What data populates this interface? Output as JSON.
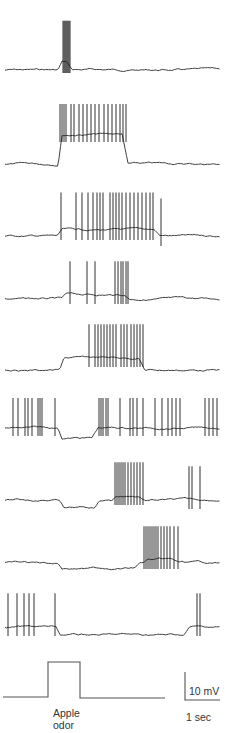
{
  "chart_data": {
    "type": "line",
    "title": "",
    "xlabel": "Time",
    "ylabel": "Membrane potential",
    "stimulus": {
      "label_line1": "Apple",
      "label_line2": "odor",
      "onset_px": 48,
      "offset_px": 80
    },
    "scale_bar": {
      "voltage": "10 mV",
      "time": "1 sec"
    },
    "traces": [
      {
        "id": 1,
        "baseline_y": 70,
        "response": "brief burst at onset then return to baseline",
        "spike_times_px": [
          63,
          64,
          65,
          66,
          67,
          68,
          69,
          70
        ]
      },
      {
        "id": 2,
        "baseline_y": 164,
        "response": "sustained depolarization with tonic firing during odor",
        "spike_times_px": [
          60,
          62,
          64,
          66,
          71,
          74,
          79,
          83,
          87,
          91,
          95,
          99,
          104,
          108,
          112,
          116,
          120,
          123,
          126
        ]
      },
      {
        "id": 3,
        "baseline_y": 236,
        "response": "depolarization with high-frequency firing during odor",
        "spike_times_px": [
          61,
          76,
          82,
          88,
          93,
          97,
          100,
          103,
          110,
          113,
          116,
          119,
          122,
          126,
          130,
          134,
          138,
          142,
          146,
          150,
          153,
          161
        ]
      },
      {
        "id": 4,
        "baseline_y": 299,
        "response": "weak depolarization with sparse spikes",
        "spike_times_px": [
          70,
          87,
          95,
          115,
          118,
          121,
          123,
          126,
          128
        ]
      },
      {
        "id": 5,
        "baseline_y": 370,
        "response": "ramped depolarization and burst",
        "spike_times_px": [
          89,
          95,
          98,
          101,
          104,
          107,
          110,
          113,
          116,
          121,
          124,
          127,
          131,
          134,
          137,
          140,
          143
        ]
      },
      {
        "id": 6,
        "baseline_y": 428,
        "response": "spontaneous firing inhibited by odor then rebound",
        "spike_times_px": [
          13,
          18,
          25,
          28,
          32,
          38,
          40,
          42,
          55,
          99,
          101,
          103,
          106,
          108,
          120,
          130,
          133,
          137,
          143,
          155,
          162,
          168,
          172,
          176,
          180,
          205,
          209,
          213,
          217
        ]
      },
      {
        "id": 7,
        "baseline_y": 500,
        "response": "delayed burst after odor",
        "spike_times_px": [
          115,
          117,
          119,
          121,
          123,
          125,
          128,
          131,
          134,
          137,
          140,
          143,
          189,
          192,
          200
        ]
      },
      {
        "id": 8,
        "baseline_y": 563,
        "response": "late delayed burst",
        "spike_times_px": [
          144,
          146,
          148,
          150,
          152,
          154,
          156,
          158,
          161,
          164,
          167,
          170,
          174,
          178
        ]
      },
      {
        "id": 9,
        "baseline_y": 627,
        "response": "spontaneous firing inhibited by odor, long silence",
        "spike_times_px": [
          8,
          17,
          24,
          29,
          34,
          55,
          197,
          200
        ]
      }
    ]
  },
  "labels": {
    "stim_line1": "Apple",
    "stim_line2": "odor",
    "scale_voltage": "10 mV",
    "scale_time": "1 sec"
  }
}
